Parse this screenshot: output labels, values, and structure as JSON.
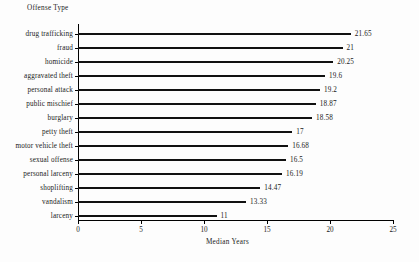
{
  "chart_data": {
    "type": "bar",
    "orientation": "horizontal",
    "title": "",
    "ylabel": "Offense Type",
    "xlabel": "Median Years",
    "xlim": [
      0,
      25
    ],
    "xticks": [
      0,
      5,
      10,
      15,
      20,
      25
    ],
    "grid": false,
    "legend": null,
    "categories": [
      "drug trafficking",
      "fraud",
      "homicide",
      "aggravated theft",
      "personal attack",
      "public mischief",
      "burglary",
      "petty theft",
      "motor vehicle theft",
      "sexual offense",
      "personal larceny",
      "shoplifting",
      "vandalism",
      "larceny"
    ],
    "values": [
      21.65,
      21,
      20.25,
      19.6,
      19.2,
      18.87,
      18.58,
      17,
      16.68,
      16.5,
      16.19,
      14.47,
      13.33,
      11
    ],
    "value_labels": [
      "21.65",
      "21",
      "20.25",
      "19.6",
      "19.2",
      "18.87",
      "18.58",
      "17",
      "16.68",
      "16.5",
      "16.19",
      "14.47",
      "13.33",
      "11"
    ],
    "bar_color": "#111111",
    "axis_color": "#000000",
    "background_color": "#fdfdfd"
  }
}
